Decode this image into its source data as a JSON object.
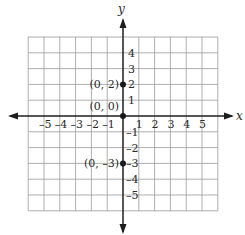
{
  "chart_data": {
    "type": "scatter",
    "title": "",
    "xlabel": "x",
    "ylabel": "y",
    "xlim": [
      -6,
      6
    ],
    "ylim": [
      -6,
      5
    ],
    "grid": true,
    "x_ticks": [
      -5,
      -4,
      -3,
      -2,
      -1,
      1,
      2,
      3,
      4,
      5
    ],
    "y_ticks": [
      4,
      3,
      2,
      1,
      -1,
      -2,
      -3,
      -4,
      -5
    ],
    "x_tick_labels": [
      "-5",
      "-4",
      "-3",
      "-2",
      "-1",
      "1",
      "2",
      "3",
      "4",
      "5"
    ],
    "y_tick_labels_pos": [
      "4",
      "3",
      "2",
      "1"
    ],
    "y_tick_labels_neg": [
      "-1",
      "-2",
      "-3",
      "-4",
      "-5"
    ],
    "points": [
      {
        "x": 0,
        "y": 2,
        "label": "(0, 2)"
      },
      {
        "x": 0,
        "y": 0,
        "label": "(0, 0)"
      },
      {
        "x": 0,
        "y": -3,
        "label": "(0, -3)"
      }
    ]
  },
  "axes": {
    "x_label": "x",
    "y_label": "y"
  },
  "colors": {
    "grid": "#9a9a9a",
    "axis": "#1e1e1e",
    "point": "#1a1a1a",
    "text": "#2a2a2a"
  }
}
